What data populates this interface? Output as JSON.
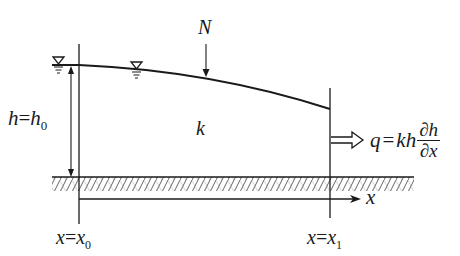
{
  "diagram": {
    "type": "unconfined-aquifer-cross-section",
    "labels": {
      "recharge": "N",
      "conductivity": "k",
      "left_head": "h = h₀",
      "left_head_lhs": "h",
      "left_head_eq": "=",
      "left_head_rhs": "h",
      "left_head_sub": "0",
      "flux_lhs": "q",
      "flux_eq": "=",
      "flux_kh": "kh",
      "flux_num": "∂h",
      "flux_den": "∂x",
      "axis": "x",
      "left_boundary_lhs": "x",
      "left_boundary_eq": "=",
      "left_boundary_rhs": "x",
      "left_boundary_sub": "0",
      "right_boundary_lhs": "x",
      "right_boundary_eq": "=",
      "right_boundary_rhs": "x",
      "right_boundary_sub": "1"
    },
    "elements": {
      "water_table": "curved line descending from x0 to x1",
      "water_level_symbols": 2,
      "impermeable_base": "hatched band",
      "outflow_arrow": "hollow double arrow at x1"
    },
    "colors": {
      "ink": "#1a1a1a",
      "hatch": "#555555",
      "background": "#ffffff"
    }
  }
}
